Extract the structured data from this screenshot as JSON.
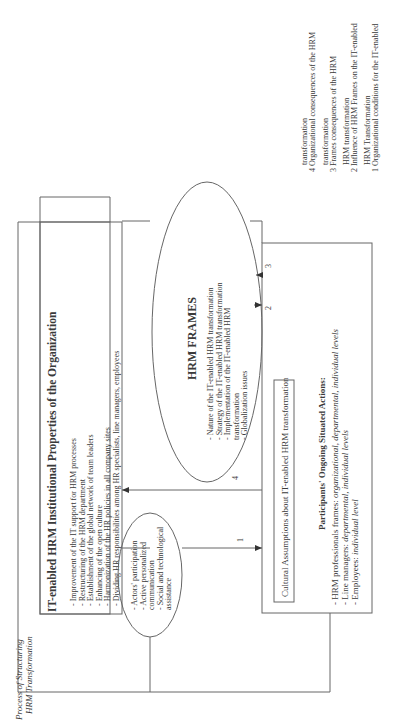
{
  "legend": [
    "1 Organizational conditions for the IT-enabled",
    "HRM Transformation",
    "2 Influence of HRM Frames on the IT-enabled",
    "HRM transformation",
    "3 Frames consequences of the HRM",
    "transformation",
    "4 Organizational consequences of the HRM",
    "transformation"
  ],
  "institutional": {
    "title": "IT-enabled HRM Institutional Properties of the Organization",
    "items": [
      "-  Improvement of the IT support for HRM processes",
      "-  Restructuring of the HRM department",
      "-  Establishment of the global network of team leaders",
      "-  Enhancing of the open culture",
      "-  Harmonization of the HR policies in all company sites",
      "-  Dividing HR responsibilities among HR specialists, line managers, employees"
    ]
  },
  "frames": {
    "title": "HRM FRAMES",
    "items": [
      "-  Nature of the IT-enabled HRM transformation",
      "-  Strategy of the IT-enabled HRM transformation",
      "-  Implementation of the IT-enabled HRM",
      "   transformation",
      "-  Globalization issues"
    ]
  },
  "conditions": {
    "items": [
      "-  Actors' participation",
      "-  Active personalized",
      "   communication",
      "-  Social and technological",
      "   assistance"
    ]
  },
  "participants": {
    "cultural": "Cultural Assumptions about IT-enabled HRM transformation",
    "title": "Participants' Ongoing Situated Actions:",
    "items": [
      {
        "label": "-  HRM professionals frames: ",
        "levels": "organizational, departmental, individual  levels"
      },
      {
        "label": "-  Line managers: ",
        "levels": "departmental, individual levels"
      },
      {
        "label": "-  Employees: ",
        "levels": "individual level"
      }
    ]
  },
  "process_label": [
    "Process of Structuring",
    "HRM Transformation"
  ],
  "arrow_labels": {
    "a1": "1",
    "a2": "2",
    "a3": "3",
    "a4": "4"
  }
}
